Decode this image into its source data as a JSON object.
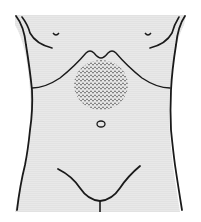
{
  "diagram": {
    "colors": {
      "background": "#ffffff",
      "skin_fill": "#e6e6e6",
      "outline": "#1a1a1a",
      "stipple": "#555555"
    },
    "regions": [
      {
        "name": "shaded-region",
        "label": "epigastric / upper abdominal area",
        "cx": 101,
        "cy": 85,
        "rx": 27,
        "ry": 25
      }
    ],
    "landmarks": [
      "left-nipple",
      "right-nipple",
      "left-costal-margin",
      "right-costal-margin",
      "xiphoid-notch",
      "umbilicus",
      "inguinal-line"
    ]
  }
}
